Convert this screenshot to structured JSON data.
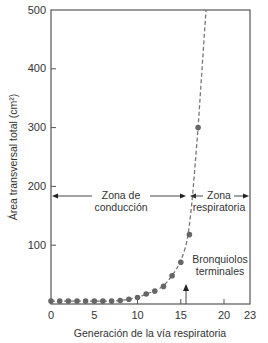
{
  "chart_data": {
    "type": "scatter",
    "title": "",
    "xlabel": "Generación de la vía respiratoria",
    "ylabel": "Área transversal total (cm²)",
    "xlim": [
      0,
      23
    ],
    "ylim": [
      0,
      500
    ],
    "x_ticks": [
      0,
      5,
      10,
      15,
      20,
      23
    ],
    "y_ticks": [
      100,
      200,
      300,
      400,
      500
    ],
    "grid": false,
    "legend": null,
    "series": [
      {
        "name": "Área transversal total",
        "style": "dashed curve with dots",
        "x": [
          0,
          1,
          2,
          3,
          4,
          5,
          6,
          7,
          8,
          9,
          10,
          11,
          12,
          13,
          14,
          15,
          16,
          17
        ],
        "values": [
          5,
          5,
          5,
          5,
          5,
          5,
          5,
          5,
          6,
          8,
          11,
          17,
          22,
          30,
          48,
          71,
          118,
          300
        ]
      }
    ],
    "annotations": [
      {
        "text": "Zona de conducción",
        "type": "double-arrow",
        "x_range": [
          0,
          16
        ],
        "y": 180
      },
      {
        "text": "Zona respiratoria",
        "type": "double-arrow",
        "x_range": [
          16,
          23
        ],
        "y": 180
      },
      {
        "text": "Bronquiolos terminales",
        "type": "up-arrow",
        "x": 16.5
      }
    ]
  },
  "labels": {
    "y_axis": "Área transversal total (cm²)",
    "x_axis": "Generación de la vía respiratoria",
    "zone_conduction_line1": "Zona de",
    "zone_conduction_line2": "conducción",
    "zone_respiratory_line1": "Zona",
    "zone_respiratory_line2": "respiratoria",
    "bronchioles_line1": "Bronquiolos",
    "bronchioles_line2": "terminales"
  },
  "ticks": {
    "x": [
      "0",
      "5",
      "10",
      "15",
      "20",
      "23"
    ],
    "y": [
      "100",
      "200",
      "300",
      "400",
      "500"
    ]
  },
  "colors": {
    "axis": "#555555",
    "points": "#666666",
    "curve": "#777777",
    "text": "#333333"
  }
}
